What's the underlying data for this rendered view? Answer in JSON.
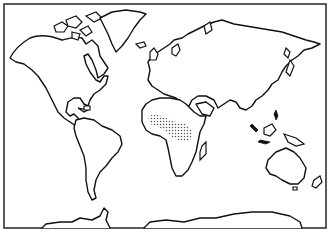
{
  "map": {
    "type": "world-outline",
    "projection": "equirectangular-like",
    "colors": {
      "background": "#ffffff",
      "outline": "#111111",
      "frame": "#333333",
      "stipple": "#555555"
    },
    "continents": [
      {
        "name": "north-america"
      },
      {
        "name": "greenland"
      },
      {
        "name": "south-america"
      },
      {
        "name": "europe-asia"
      },
      {
        "name": "africa"
      },
      {
        "name": "australia"
      },
      {
        "name": "antarctica"
      }
    ],
    "highlighted_region": {
      "name": "sub-saharan-band",
      "continent": "africa",
      "pattern": "stipple"
    }
  }
}
